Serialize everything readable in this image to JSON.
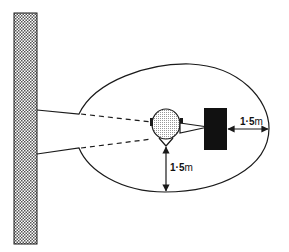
{
  "diagram": {
    "elements": {
      "wall": "hatched wall",
      "zone": "oval clearance zone",
      "person": "head viewed from above",
      "machine": "black equipment block"
    },
    "dimensions": {
      "horizontal": {
        "value": "1·5",
        "unit": "m"
      },
      "vertical": {
        "value": "1·5",
        "unit": "m"
      }
    },
    "colors": {
      "line": "#1a1a1a",
      "fill_block": "#111111",
      "background": "#ffffff"
    }
  }
}
